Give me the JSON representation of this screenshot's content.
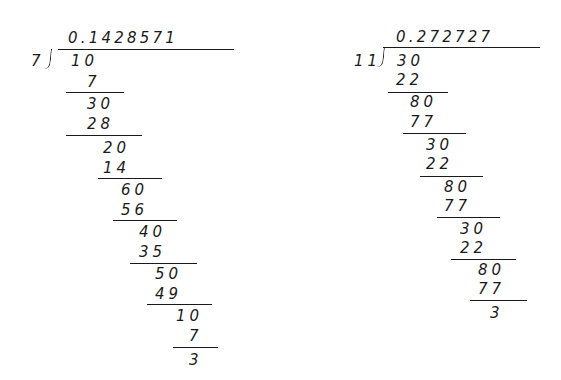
{
  "left_division": {
    "divisor": "7",
    "dividend": "10",
    "quotient": "0.1428571",
    "steps": [
      {
        "label": "7",
        "x": 87,
        "y": 82
      },
      {
        "label": "30",
        "x": 87,
        "y": 104
      },
      {
        "label": "28",
        "x": 87,
        "y": 124
      },
      {
        "label": "20",
        "x": 103,
        "y": 148
      },
      {
        "label": "14",
        "x": 103,
        "y": 168
      },
      {
        "label": "60",
        "x": 121,
        "y": 190
      },
      {
        "label": "56",
        "x": 121,
        "y": 210
      },
      {
        "label": "40",
        "x": 139,
        "y": 232
      },
      {
        "label": "35",
        "x": 139,
        "y": 252
      },
      {
        "label": "50",
        "x": 155,
        "y": 274
      },
      {
        "label": "49",
        "x": 155,
        "y": 294
      },
      {
        "label": "10",
        "x": 176,
        "y": 316
      },
      {
        "label": "7",
        "x": 189,
        "y": 336
      },
      {
        "label": "3",
        "x": 189,
        "y": 360
      }
    ],
    "rules": [
      {
        "x1": 66,
        "x2": 124,
        "y": 92
      },
      {
        "x1": 66,
        "x2": 142,
        "y": 135
      },
      {
        "x1": 98,
        "x2": 162,
        "y": 178
      },
      {
        "x1": 113,
        "x2": 177,
        "y": 220
      },
      {
        "x1": 130,
        "x2": 197,
        "y": 263
      },
      {
        "x1": 147,
        "x2": 212,
        "y": 304
      },
      {
        "x1": 173,
        "x2": 218,
        "y": 347
      }
    ]
  },
  "right_division": {
    "divisor": "11",
    "dividend": "30",
    "quotient": "0.272727",
    "steps": [
      {
        "label": "22",
        "x": 396,
        "y": 80
      },
      {
        "label": "80",
        "x": 410,
        "y": 102
      },
      {
        "label": "77",
        "x": 410,
        "y": 122
      },
      {
        "label": "30",
        "x": 426,
        "y": 145
      },
      {
        "label": "22",
        "x": 426,
        "y": 164
      },
      {
        "label": "80",
        "x": 444,
        "y": 187
      },
      {
        "label": "77",
        "x": 444,
        "y": 206
      },
      {
        "label": "30",
        "x": 460,
        "y": 229
      },
      {
        "label": "22",
        "x": 460,
        "y": 248
      },
      {
        "label": "80",
        "x": 478,
        "y": 270
      },
      {
        "label": "77",
        "x": 478,
        "y": 289
      },
      {
        "label": "3",
        "x": 490,
        "y": 313
      }
    ],
    "rules": [
      {
        "x1": 388,
        "x2": 448,
        "y": 92
      },
      {
        "x1": 403,
        "x2": 466,
        "y": 133
      },
      {
        "x1": 420,
        "x2": 483,
        "y": 176
      },
      {
        "x1": 437,
        "x2": 500,
        "y": 217
      },
      {
        "x1": 451,
        "x2": 516,
        "y": 259
      },
      {
        "x1": 470,
        "x2": 527,
        "y": 300
      }
    ]
  }
}
